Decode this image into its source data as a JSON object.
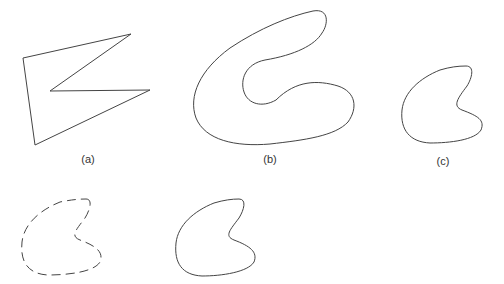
{
  "figure": {
    "panels": [
      {
        "id": "a",
        "label": "(a)",
        "description": "polygon approximation"
      },
      {
        "id": "b",
        "label": "(b)",
        "description": "smooth C-shaped closed curve"
      },
      {
        "id": "c",
        "label": "(c)",
        "description": "smaller smooth C-shaped closed curve"
      }
    ],
    "bottom_row": [
      {
        "id": "dashed",
        "description": "dashed outline of C shape"
      },
      {
        "id": "solid",
        "description": "solid outline of C shape"
      }
    ],
    "stroke_color": "#444444"
  }
}
